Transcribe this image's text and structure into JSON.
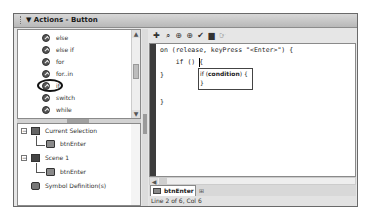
{
  "panel": {
    "title": "Actions - Button",
    "collapse_glyph": "▼"
  },
  "actions_list": {
    "items": [
      {
        "label": "else",
        "icon": "action-circle-icon"
      },
      {
        "label": "else if",
        "icon": "action-circle-icon"
      },
      {
        "label": "for",
        "icon": "action-circle-icon"
      },
      {
        "label": "for..in",
        "icon": "action-circle-icon"
      },
      {
        "label": "if",
        "icon": "action-circle-icon",
        "highlighted": true
      },
      {
        "label": "switch",
        "icon": "action-circle-icon"
      },
      {
        "label": "while",
        "icon": "action-circle-icon"
      }
    ],
    "scroll_up": "▲",
    "scroll_down": "▼"
  },
  "script_nav": {
    "items": [
      {
        "label": "Current Selection",
        "expander": "−",
        "icon": "current-selection-icon"
      },
      {
        "label": "btnEnter",
        "icon": "button-symbol-icon"
      },
      {
        "label": "Scene 1",
        "expander": "−",
        "icon": "scene-icon"
      },
      {
        "label": "btnEnter",
        "icon": "button-symbol-icon"
      },
      {
        "label": "Symbol Definition(s)",
        "icon": "symbol-definitions-icon"
      }
    ]
  },
  "toolbar": {
    "icons": [
      {
        "name": "add-statement-icon",
        "glyph": "✚"
      },
      {
        "name": "find-icon",
        "glyph": "⌕"
      },
      {
        "name": "insert-target-path-icon",
        "glyph": "⊕"
      },
      {
        "name": "check-syntax-crosshair-icon",
        "glyph": "⊕"
      },
      {
        "name": "check-syntax-icon",
        "glyph": "✔"
      },
      {
        "name": "auto-format-icon",
        "glyph": "▆"
      },
      {
        "name": "show-code-hint-icon",
        "glyph": "☞"
      }
    ]
  },
  "code": {
    "lines": [
      "on (release, keyPress \"<Enter>\") {",
      "    if () {",
      "}",
      "",
      "}"
    ],
    "hint": {
      "prefix": "if (",
      "param": "condition",
      "suffix": ") {",
      "close": "}"
    }
  },
  "tabs": {
    "active": "btnEnter",
    "pin_glyph": "⊞"
  },
  "status": {
    "text": "Line 2 of 6, Col 6"
  },
  "hscroll": {
    "left_arrow": "◀"
  }
}
